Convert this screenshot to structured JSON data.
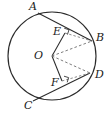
{
  "figure": {
    "stroke_color": "#2b2b2b",
    "dash_color": "#6e6e6e",
    "background_color": "#ffffff",
    "circle": {
      "name": "circle-O",
      "center_label": "O",
      "center_x": 52,
      "center_y": 56,
      "radius": 44
    },
    "points": [
      {
        "id": "A",
        "label": "A",
        "x": 38,
        "y": 13,
        "label_x": 29,
        "label_y": 1,
        "on_circle": true
      },
      {
        "id": "B",
        "label": "B",
        "x": 92,
        "y": 41,
        "label_x": 96,
        "label_y": 32,
        "on_circle": true
      },
      {
        "id": "C",
        "label": "C",
        "x": 33,
        "y": 101,
        "label_x": 24,
        "label_y": 100,
        "on_circle": true
      },
      {
        "id": "D",
        "label": "D",
        "x": 90,
        "y": 73,
        "label_x": 95,
        "label_y": 69,
        "on_circle": true
      },
      {
        "id": "E",
        "label": "E",
        "x": 65,
        "y": 33,
        "label_x": 53,
        "label_y": 26,
        "on_circle": false
      },
      {
        "id": "F",
        "label": "F",
        "x": 62,
        "y": 81,
        "label_x": 51,
        "label_y": 77,
        "on_circle": false
      },
      {
        "id": "O",
        "label": "O",
        "x": 52,
        "y": 56,
        "label_x": 34,
        "label_y": 50,
        "on_circle": false
      }
    ],
    "chords": [
      {
        "name": "chord-AB",
        "from": "A",
        "to": "B",
        "style": "solid"
      },
      {
        "name": "chord-CD",
        "from": "C",
        "to": "D",
        "style": "solid"
      }
    ],
    "segments": [
      {
        "name": "segment-OE",
        "from": "O",
        "to": "E",
        "style": "solid"
      },
      {
        "name": "segment-OF",
        "from": "O",
        "to": "F",
        "style": "solid"
      },
      {
        "name": "radius-OB",
        "from": "O",
        "to": "B",
        "style": "dashed"
      },
      {
        "name": "radius-OD",
        "from": "O",
        "to": "D",
        "style": "dashed"
      },
      {
        "name": "segment-EB",
        "from": "E",
        "to": "B",
        "style": "dashed"
      },
      {
        "name": "segment-FD",
        "from": "F",
        "to": "D",
        "style": "dashed"
      }
    ],
    "right_angles": [
      {
        "name": "right-angle-at-E",
        "at": "E",
        "x": 68,
        "y": 30
      },
      {
        "name": "right-angle-at-F",
        "at": "F",
        "x": 66,
        "y": 79
      }
    ]
  }
}
